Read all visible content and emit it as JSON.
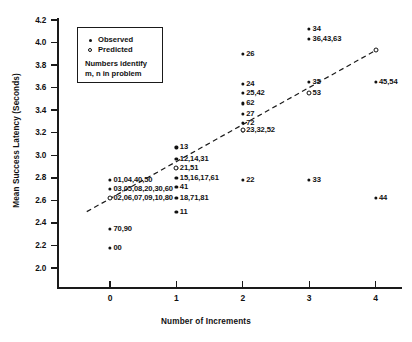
{
  "chart_data": {
    "type": "scatter",
    "title": "",
    "xlabel": "Number of Increments",
    "ylabel": "Mean Success Latency (Seconds)",
    "xlim": [
      -0.6,
      4.4
    ],
    "ylim": [
      1.88,
      4.25
    ],
    "xticks": [
      "0",
      "1",
      "2",
      "3",
      "4"
    ],
    "xtick_values": [
      0,
      1,
      2,
      3,
      4
    ],
    "yticks": [
      "2.0",
      "2.2",
      "2.4",
      "2.6",
      "2.8",
      "3.0",
      "3.2",
      "3.4",
      "3.6",
      "3.8",
      "4.0",
      "4.2"
    ],
    "ytick_values": [
      2.0,
      2.2,
      2.4,
      2.6,
      2.8,
      3.0,
      3.2,
      3.4,
      3.6,
      3.8,
      4.0,
      4.2
    ],
    "grid": false,
    "legend_position": "upper-left-inset",
    "legend": {
      "observed_label": "Observed",
      "predicted_label": "Predicted",
      "note_line1": "Numbers identify",
      "note_line2": "m, n in problem"
    },
    "series": [
      {
        "name": "Observed",
        "marker": "filled-circle",
        "points": [
          {
            "x": 0,
            "y": 2.78,
            "label": "01,04,40,50",
            "label_side": "right"
          },
          {
            "x": 0,
            "y": 2.7,
            "label": "03,05,08,20,30,60",
            "label_side": "right"
          },
          {
            "x": 0,
            "y": 2.62,
            "label": "02,06,07,09,10,80",
            "label_side": "right"
          },
          {
            "x": 0,
            "y": 2.35,
            "label": "70,90",
            "label_side": "right"
          },
          {
            "x": 0,
            "y": 2.18,
            "label": "00",
            "label_side": "right"
          },
          {
            "x": 1,
            "y": 3.07,
            "label": "13",
            "label_side": "right"
          },
          {
            "x": 1,
            "y": 2.97,
            "label": "12,14,31",
            "label_side": "right"
          },
          {
            "x": 1,
            "y": 2.89,
            "label": "21,51",
            "label_side": "right"
          },
          {
            "x": 1,
            "y": 2.8,
            "label": "15,16,17,61",
            "label_side": "right"
          },
          {
            "x": 1,
            "y": 2.72,
            "label": "41",
            "label_side": "right"
          },
          {
            "x": 1,
            "y": 2.62,
            "label": "18,71,81",
            "label_side": "right"
          },
          {
            "x": 1,
            "y": 2.5,
            "label": "11",
            "label_side": "right"
          },
          {
            "x": 2,
            "y": 3.9,
            "label": "26",
            "label_side": "right"
          },
          {
            "x": 2,
            "y": 3.63,
            "label": "24",
            "label_side": "right"
          },
          {
            "x": 2,
            "y": 3.55,
            "label": "25,42",
            "label_side": "right"
          },
          {
            "x": 2,
            "y": 3.46,
            "label": "62",
            "label_side": "right"
          },
          {
            "x": 2,
            "y": 3.37,
            "label": "27",
            "label_side": "right"
          },
          {
            "x": 2,
            "y": 3.29,
            "label": "72",
            "label_side": "right"
          },
          {
            "x": 2,
            "y": 3.22,
            "label": "23,32,52",
            "label_side": "right"
          },
          {
            "x": 2,
            "y": 2.78,
            "label": "22",
            "label_side": "right"
          },
          {
            "x": 3,
            "y": 4.12,
            "label": "34",
            "label_side": "right"
          },
          {
            "x": 3,
            "y": 4.03,
            "label": "36,43,63",
            "label_side": "right"
          },
          {
            "x": 3,
            "y": 3.65,
            "label": "35",
            "label_side": "right"
          },
          {
            "x": 3,
            "y": 3.55,
            "label": "53",
            "label_side": "right"
          },
          {
            "x": 3,
            "y": 2.78,
            "label": "33",
            "label_side": "right"
          },
          {
            "x": 4,
            "y": 3.65,
            "label": "45,54",
            "label_side": "right"
          },
          {
            "x": 4,
            "y": 2.62,
            "label": "44",
            "label_side": "right"
          }
        ]
      },
      {
        "name": "Predicted",
        "marker": "open-circle",
        "points": [
          {
            "x": 0,
            "y": 2.62,
            "label": ""
          },
          {
            "x": 1,
            "y": 2.89,
            "label": ""
          },
          {
            "x": 2,
            "y": 3.22,
            "label": ""
          },
          {
            "x": 3,
            "y": 3.55,
            "label": ""
          },
          {
            "x": 4,
            "y": 3.93,
            "label": ""
          }
        ]
      }
    ],
    "fit_line": {
      "style": "dashed",
      "from": {
        "x": -0.35,
        "y": 2.5
      },
      "to": {
        "x": 4.0,
        "y": 3.93
      }
    }
  }
}
